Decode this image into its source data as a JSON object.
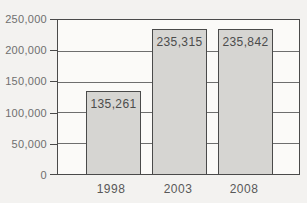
{
  "chart_data": {
    "type": "bar",
    "categories": [
      "1998",
      "2003",
      "2008"
    ],
    "values": [
      135261,
      235315,
      235842
    ],
    "value_labels": [
      "135,261",
      "235,315",
      "235,842"
    ],
    "ytick_values": [
      250000,
      200000,
      150000,
      100000,
      50000,
      0
    ],
    "ytick_labels": [
      "250,000",
      "200,000",
      "150,000",
      "100,000",
      "50,000",
      "0"
    ],
    "title": "",
    "xlabel": "",
    "ylabel": "",
    "ylim": [
      0,
      250000
    ],
    "grid": "horizontal",
    "legend": "none",
    "colors": {
      "bar_fill": "#d6d5d2",
      "bar_border": "#4a4a4a",
      "gridline": "#6e6e6e",
      "plot_border": "#4a4a4a",
      "plot_background": "#fbfaf8",
      "page_background": "#f3f2f0",
      "value_label_text": "#4c4c4c",
      "axis_label_text": "#6f6f6f"
    }
  }
}
